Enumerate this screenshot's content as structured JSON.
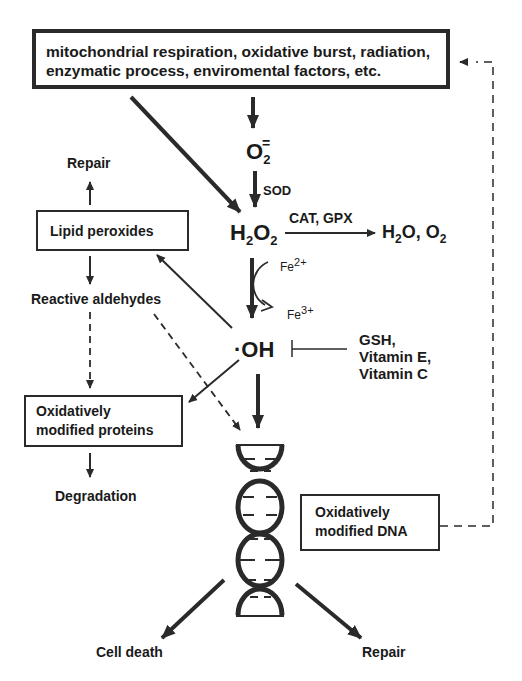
{
  "sources": {
    "line1": "mitochondrial respiration, oxidative burst, radiation,",
    "line2": "enzymatic process, enviromental factors, etc."
  },
  "species": {
    "superoxide": {
      "base": "O",
      "sub": "2",
      "sup": "·"
    },
    "hydrogen_peroxide": {
      "h": "H",
      "h_sub": "2",
      "o": "O",
      "o_sub": "2"
    },
    "hydroxyl": "·OH",
    "products": {
      "a": "H",
      "a_sub": "2",
      "b": "O, O",
      "b_sub": "2"
    }
  },
  "enzymes": {
    "sod": "SOD",
    "cat_gpx": "CAT, GPX"
  },
  "iron": {
    "fe2": {
      "base": "Fe",
      "sup": "2+"
    },
    "fe3": {
      "base": "Fe",
      "sup": "3+"
    }
  },
  "antioxidants": [
    "GSH,",
    "Vitamin E,",
    "Vitamin C"
  ],
  "left_branch": {
    "repair": "Repair",
    "lipid_peroxides": "Lipid peroxides",
    "reactive_aldehydes": "Reactive aldehydes",
    "proteins_line1": "Oxidatively",
    "proteins_line2": "modified proteins",
    "degradation": "Degradation"
  },
  "dna_branch": {
    "dna_line1": "Oxidatively",
    "dna_line2": "modified DNA",
    "cell_death": "Cell death",
    "repair": "Repair"
  }
}
